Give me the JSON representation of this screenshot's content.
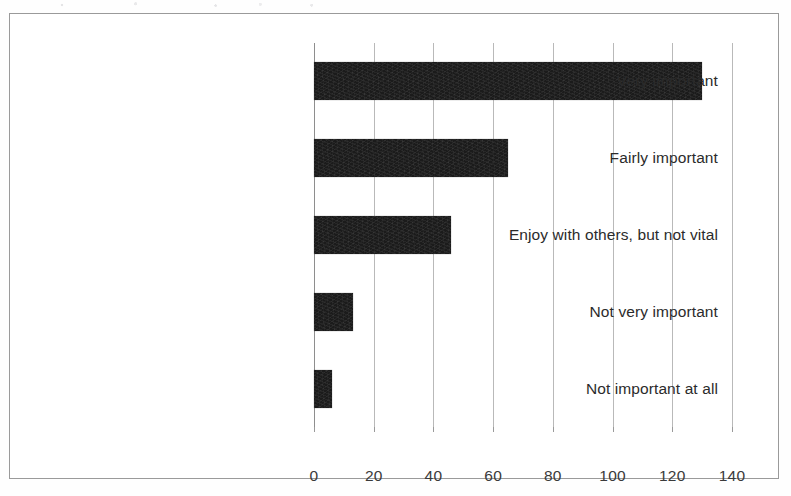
{
  "figure": {
    "frame_border_color": "#9a9a9a",
    "background_color": "#ffffff",
    "bar_color": "#1b1b1b",
    "gridline_color": "#b9b9b9"
  },
  "chart_data": {
    "type": "bar",
    "orientation": "horizontal",
    "title": "",
    "subtitle": "",
    "xlabel": "",
    "ylabel": "",
    "categories": [
      "Very important",
      "Fairly important",
      "Enjoy with others, but not vital",
      "Not very important",
      "Not important at all"
    ],
    "values": [
      130,
      65,
      46,
      13,
      6
    ],
    "xlim": [
      0,
      140
    ],
    "xticks": [
      0,
      20,
      40,
      60,
      80,
      100,
      120,
      140
    ],
    "xtick_labels": [
      "0",
      "20",
      "40",
      "60",
      "80",
      "100",
      "120",
      "140"
    ],
    "grid": "vertical",
    "legend": "none",
    "annotations": []
  }
}
